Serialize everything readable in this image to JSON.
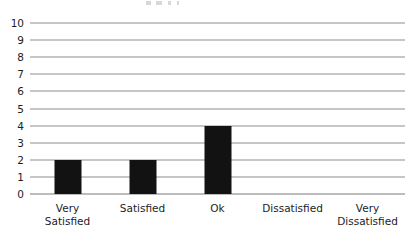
{
  "chart_data": {
    "type": "bar",
    "title": "",
    "xlabel": "",
    "ylabel": "",
    "categories": [
      "Very Satisfied",
      "Satisfied",
      "Ok",
      "Dissatisfied",
      "Very Dissatisfied"
    ],
    "values": [
      2,
      2,
      4,
      0,
      0
    ],
    "ylim": [
      0,
      10
    ],
    "ytick_labels": [
      "10",
      "9",
      "8",
      "7",
      "6",
      "5",
      "4",
      "3",
      "2",
      "1",
      "0"
    ],
    "ytick_values": [
      10,
      9,
      8,
      7,
      6,
      5,
      4,
      3,
      2,
      1,
      0
    ],
    "ytick_step": 1,
    "grid": true,
    "legend": false,
    "legend_position": "none",
    "bar_color": "#121212",
    "grid_color": "#8d8d8d",
    "axis_color": "#7a7a7a",
    "background_color": "#ffffff",
    "text_color": "#1d1d1d",
    "category_label_lines": [
      [
        "Very",
        "Satisfied"
      ],
      [
        "Satisfied"
      ],
      [
        "Ok"
      ],
      [
        "Dissatisfied"
      ],
      [
        "Very",
        "Dissatisfied"
      ]
    ]
  }
}
